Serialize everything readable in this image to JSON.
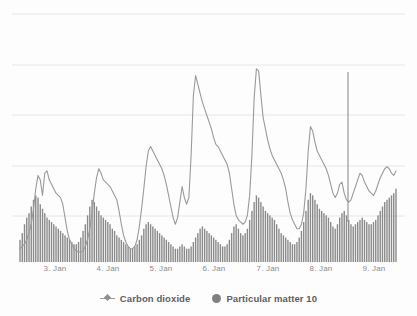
{
  "chart_data": {
    "type": "bar",
    "title": "",
    "subtitle": "",
    "xlabel": "",
    "ylabel": "",
    "grid": true,
    "legend_position": "bottom",
    "x_tick_labels": [
      "3. Jan",
      "4. Jan",
      "5. Jan",
      "6. Jan",
      "7. Jan",
      "8. Jan",
      "9. Jan"
    ],
    "x_tick_positions_px": [
      55,
      108,
      161,
      214,
      268,
      321,
      374
    ],
    "y_gridlines_px": [
      14,
      65,
      115,
      166,
      216
    ],
    "baseline_px": 262,
    "plot_left_px": 20,
    "plot_right_px": 396,
    "colors": {
      "bar": "#8a8a8a",
      "line": "#9a9a9a",
      "gridline": "#e8e6e2",
      "background": "#fdfdfd",
      "tick_label": "#8c8c8c",
      "legend_label": "#5d5d5d"
    },
    "series": [
      {
        "name": "Carbon dioxide",
        "type": "line",
        "marker": "diamond-line",
        "color": "#9a9a9a",
        "values": [
          12,
          14,
          16,
          20,
          26,
          34,
          48,
          66,
          78,
          74,
          60,
          80,
          82,
          74,
          70,
          66,
          62,
          60,
          58,
          52,
          40,
          28,
          20,
          16,
          12,
          10,
          9,
          9,
          10,
          14,
          20,
          30,
          44,
          62,
          76,
          84,
          80,
          74,
          72,
          70,
          68,
          64,
          60,
          56,
          46,
          34,
          24,
          18,
          14,
          12,
          12,
          14,
          20,
          32,
          48,
          66,
          86,
          100,
          104,
          100,
          96,
          92,
          88,
          84,
          78,
          70,
          60,
          50,
          40,
          34,
          40,
          54,
          68,
          58,
          52,
          58,
          96,
          150,
          168,
          160,
          152,
          144,
          138,
          132,
          126,
          120,
          112,
          106,
          104,
          100,
          96,
          92,
          88,
          80,
          66,
          52,
          42,
          38,
          36,
          34,
          36,
          42,
          60,
          96,
          148,
          174,
          172,
          150,
          130,
          120,
          110,
          102,
          96,
          92,
          88,
          84,
          80,
          74,
          66,
          54,
          44,
          38,
          34,
          30,
          30,
          34,
          44,
          66,
          100,
          122,
          118,
          108,
          100,
          96,
          92,
          88,
          84,
          78,
          70,
          62,
          58,
          62,
          70,
          72,
          62,
          56,
          54,
          56,
          62,
          68,
          74,
          80,
          78,
          72,
          68,
          64,
          62,
          60,
          64,
          70,
          76,
          80,
          84,
          86,
          84,
          80,
          78,
          82
        ],
        "notes": "Hourly readings; repeated daily diurnal peaks, largest on 6.-7. Jan."
      },
      {
        "name": "Particular matter 10",
        "type": "bar",
        "marker": "circle",
        "color": "#8a8a8a",
        "values": [
          20,
          26,
          34,
          40,
          44,
          50,
          56,
          60,
          58,
          52,
          48,
          44,
          40,
          38,
          36,
          34,
          32,
          30,
          28,
          26,
          24,
          22,
          20,
          18,
          16,
          16,
          18,
          22,
          28,
          34,
          42,
          50,
          56,
          54,
          50,
          46,
          42,
          40,
          38,
          36,
          34,
          30,
          28,
          24,
          22,
          20,
          18,
          16,
          14,
          12,
          12,
          14,
          16,
          20,
          24,
          30,
          34,
          36,
          34,
          32,
          30,
          28,
          26,
          24,
          22,
          20,
          18,
          16,
          14,
          12,
          12,
          14,
          16,
          14,
          12,
          12,
          14,
          18,
          22,
          26,
          30,
          32,
          30,
          28,
          26,
          24,
          22,
          20,
          18,
          16,
          14,
          14,
          16,
          20,
          26,
          32,
          34,
          30,
          26,
          24,
          26,
          30,
          38,
          46,
          54,
          60,
          58,
          54,
          50,
          46,
          44,
          42,
          40,
          38,
          34,
          30,
          26,
          24,
          22,
          20,
          18,
          16,
          16,
          18,
          22,
          28,
          36,
          46,
          56,
          62,
          60,
          56,
          52,
          48,
          46,
          44,
          42,
          40,
          36,
          32,
          30,
          34,
          40,
          44,
          46,
          42,
          38,
          34,
          32,
          34,
          36,
          38,
          40,
          38,
          36,
          34,
          34,
          36,
          38,
          42,
          46,
          50,
          54,
          56,
          58,
          60,
          62,
          66
        ],
        "notes": "Hourly bar readings; dense thin bars across the full range."
      }
    ],
    "annotations": [
      {
        "text": "tall narrow spike",
        "series": "Carbon dioxide",
        "x_px": 348,
        "y_px": 72
      }
    ]
  },
  "legend": {
    "items": [
      {
        "label": "Carbon dioxide",
        "icon": "line-diamond-marker-icon"
      },
      {
        "label": "Particular matter 10",
        "icon": "filled-circle-icon"
      }
    ]
  }
}
